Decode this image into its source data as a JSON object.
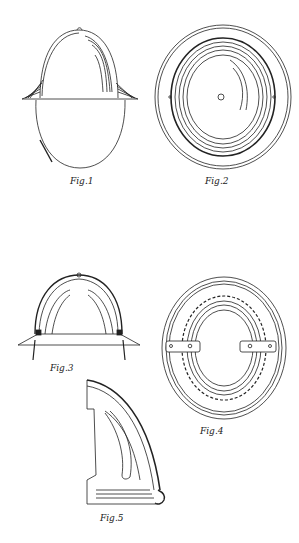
{
  "document": {
    "type": "patent drawing sheet",
    "subject": "helmet",
    "figures": [
      {
        "id": "fig1",
        "label": "Fig.1",
        "view": "front elevation of helmet with chin strap"
      },
      {
        "id": "fig2",
        "label": "Fig.2",
        "view": "top plan view of helmet crown"
      },
      {
        "id": "fig3",
        "label": "Fig.3",
        "view": "sectional front view with suspension"
      },
      {
        "id": "fig4",
        "label": "Fig.4",
        "view": "bottom plan view showing inner band and clips"
      },
      {
        "id": "fig5",
        "label": "Fig.5",
        "view": "enlarged partial section of shell edge"
      }
    ]
  },
  "colors": {
    "ink": "#222222",
    "paper": "#ffffff"
  }
}
